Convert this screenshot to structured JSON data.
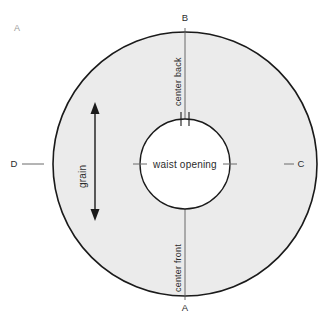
{
  "diagram": {
    "title_label": "A",
    "fill_color": "#ebebeb",
    "stroke_color": "#1a1a1a",
    "label_gray": "#9a9a9a",
    "points": {
      "top": "B",
      "bottom": "A",
      "right": "C",
      "left": "D"
    },
    "annotations": {
      "center_back": "center back",
      "center_front": "center front",
      "waist_opening": "waist opening",
      "grain": "grain"
    },
    "geometry": {
      "center_x": 185,
      "center_y": 164,
      "outer_radius": 132,
      "inner_radius": 45,
      "grain_arrow_x": 95,
      "grain_arrow_top": 103,
      "grain_arrow_bottom": 220
    }
  }
}
